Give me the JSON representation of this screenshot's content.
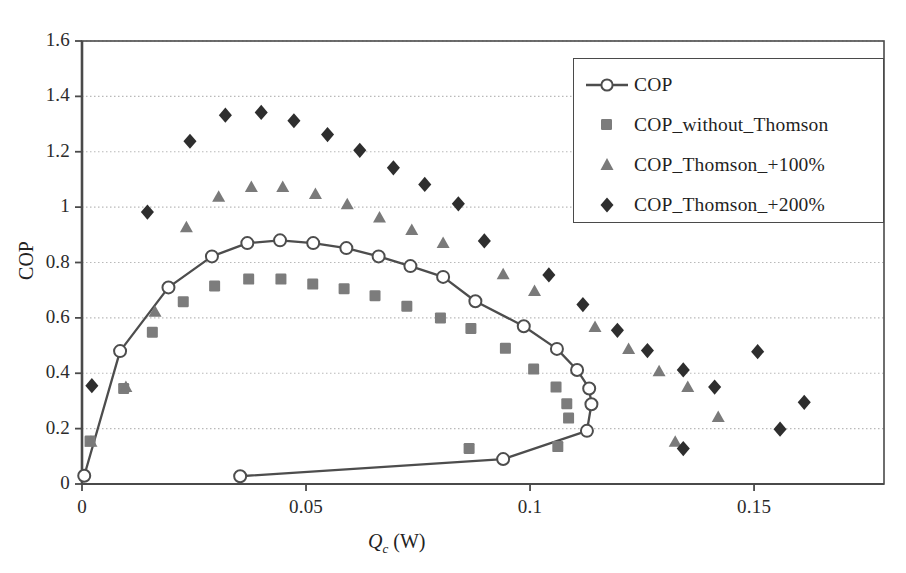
{
  "chart_data": {
    "type": "scatter",
    "title": "",
    "xlabel": "Qc (W)",
    "ylabel": "COP",
    "xlim": [
      0,
      0.179
    ],
    "ylim": [
      0,
      1.6
    ],
    "xticks": [
      "0",
      "0.05",
      "0.1",
      "0.15"
    ],
    "xtick_values": [
      0,
      0.05,
      0.1,
      0.15
    ],
    "yticks": [
      "0",
      "0.2",
      "0.4",
      "0.6",
      "0.8",
      "1",
      "1.2",
      "1.4",
      "1.6"
    ],
    "ytick_values": [
      0,
      0.2,
      0.4,
      0.6,
      0.8,
      1.0,
      1.2,
      1.4,
      1.6
    ],
    "grid": "horizontal-dotted",
    "legend_position": "top-right-inside",
    "series": [
      {
        "name": "COP",
        "marker": "open-circle",
        "line": true,
        "color": "#4d4d4d",
        "points": [
          [
            0.0005,
            0.03
          ],
          [
            0.0085,
            0.48
          ],
          [
            0.0193,
            0.71
          ],
          [
            0.029,
            0.822
          ],
          [
            0.0369,
            0.87
          ],
          [
            0.0442,
            0.88
          ],
          [
            0.0516,
            0.87
          ],
          [
            0.059,
            0.852
          ],
          [
            0.0662,
            0.822
          ],
          [
            0.0733,
            0.787
          ],
          [
            0.0806,
            0.748
          ],
          [
            0.0878,
            0.66
          ],
          [
            0.0986,
            0.57
          ],
          [
            0.106,
            0.488
          ],
          [
            0.1105,
            0.412
          ],
          [
            0.1132,
            0.345
          ],
          [
            0.1137,
            0.288
          ],
          [
            0.1127,
            0.192
          ],
          [
            0.094,
            0.09
          ],
          [
            0.0353,
            0.028
          ]
        ]
      },
      {
        "name": "COP_without_Thomson",
        "marker": "filled-square",
        "line": false,
        "color": "#7c7c7c",
        "points": [
          [
            0.0018,
            0.155
          ],
          [
            0.0093,
            0.345
          ],
          [
            0.0157,
            0.548
          ],
          [
            0.0226,
            0.658
          ],
          [
            0.0296,
            0.715
          ],
          [
            0.0372,
            0.74
          ],
          [
            0.0444,
            0.74
          ],
          [
            0.0515,
            0.722
          ],
          [
            0.0585,
            0.705
          ],
          [
            0.0654,
            0.68
          ],
          [
            0.0725,
            0.642
          ],
          [
            0.08,
            0.6
          ],
          [
            0.0868,
            0.562
          ],
          [
            0.0945,
            0.49
          ],
          [
            0.1008,
            0.415
          ],
          [
            0.1058,
            0.35
          ],
          [
            0.1082,
            0.29
          ],
          [
            0.1086,
            0.238
          ],
          [
            0.1062,
            0.135
          ],
          [
            0.0864,
            0.128
          ]
        ]
      },
      {
        "name": "COP_Thomson_+100%",
        "marker": "filled-triangle",
        "line": false,
        "color": "#7a7a7a",
        "points": [
          [
            0.002,
            0.15
          ],
          [
            0.0098,
            0.348
          ],
          [
            0.0163,
            0.62
          ],
          [
            0.0233,
            0.925
          ],
          [
            0.0305,
            1.035
          ],
          [
            0.0378,
            1.07
          ],
          [
            0.0448,
            1.07
          ],
          [
            0.0521,
            1.045
          ],
          [
            0.0592,
            1.008
          ],
          [
            0.0664,
            0.96
          ],
          [
            0.0736,
            0.915
          ],
          [
            0.0806,
            0.868
          ],
          [
            0.094,
            0.755
          ],
          [
            0.101,
            0.695
          ],
          [
            0.1145,
            0.565
          ],
          [
            0.122,
            0.485
          ],
          [
            0.1288,
            0.405
          ],
          [
            0.1352,
            0.348
          ],
          [
            0.142,
            0.24
          ],
          [
            0.1324,
            0.15
          ]
        ]
      },
      {
        "name": "COP_Thomson_+200%",
        "marker": "filled-diamond",
        "line": false,
        "color": "#2e2e2e",
        "points": [
          [
            0.0022,
            0.355
          ],
          [
            0.0146,
            0.982
          ],
          [
            0.0241,
            1.238
          ],
          [
            0.032,
            1.332
          ],
          [
            0.04,
            1.342
          ],
          [
            0.0473,
            1.312
          ],
          [
            0.0548,
            1.262
          ],
          [
            0.062,
            1.205
          ],
          [
            0.0695,
            1.142
          ],
          [
            0.0765,
            1.082
          ],
          [
            0.084,
            1.012
          ],
          [
            0.0898,
            0.878
          ],
          [
            0.1042,
            0.755
          ],
          [
            0.1118,
            0.648
          ],
          [
            0.1195,
            0.555
          ],
          [
            0.1262,
            0.482
          ],
          [
            0.1342,
            0.412
          ],
          [
            0.1412,
            0.35
          ],
          [
            0.1558,
            0.198
          ],
          [
            0.1342,
            0.128
          ],
          [
            0.1612,
            0.295
          ],
          [
            0.1508,
            0.478
          ]
        ]
      }
    ]
  },
  "axis": {
    "ylabel": "COP",
    "xlabel_main": "Q",
    "xlabel_sub": "c",
    "xlabel_unit": " (W)"
  },
  "legend": {
    "entries": [
      {
        "label": "COP",
        "marker": "open-circle-line"
      },
      {
        "label": "COP_without_Thomson",
        "marker": "filled-square"
      },
      {
        "label": "COP_Thomson_+100%",
        "marker": "filled-triangle"
      },
      {
        "label": "COP_Thomson_+200%",
        "marker": "filled-diamond"
      }
    ]
  },
  "colors": {
    "axis": "#4a4a4a",
    "grid": "#b9b9b9",
    "cop_line": "#4d4d4d",
    "square": "#7c7c7c",
    "triangle": "#7a7a7a",
    "diamond": "#2e2e2e",
    "background": "#ffffff"
  }
}
